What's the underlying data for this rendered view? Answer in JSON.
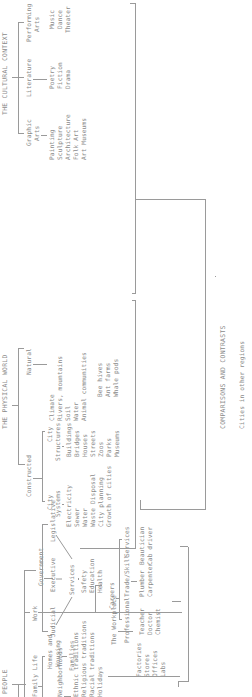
{
  "diagram": {
    "type": "tree",
    "orientation": "rotated-90-ccw",
    "line_color": "#9a9a9a",
    "text_color": "#8a8a8a",
    "sections": {
      "cultural": {
        "title": "THE CULTURAL CONTEXT",
        "branches": [
          {
            "label_1": "Performing",
            "label_2": "Arts",
            "items": [
              "Music",
              "Dance",
              "Theater"
            ]
          },
          {
            "label_1": "Literature",
            "label_2": "",
            "items": [
              "Poetry",
              "Fiction",
              "Drama"
            ]
          },
          {
            "label_1": "Graphic",
            "label_2": "Arts",
            "items": [
              "Painting",
              "Sculpture",
              "Architecture",
              "Folk Art",
              "Art Museums"
            ]
          }
        ]
      },
      "physical": {
        "title": "THE PHYSICAL WORLD",
        "natural": {
          "label": "Natural",
          "items": [
            "Climate",
            "Rivers, mountains",
            "Soil",
            "Water",
            "Animal communities"
          ],
          "sub_items": [
            "Bee hives",
            "Ant farms",
            "Whale pods"
          ]
        },
        "constructed": {
          "label": "Constructed",
          "structures": {
            "label_1": "City",
            "label_2": "Structures",
            "items": [
              "Buildings",
              "Bridges",
              "Houses",
              "Streets",
              "Zoos",
              "Parks",
              "Museums"
            ]
          },
          "systems": {
            "label_1": "City",
            "label_2": "Systems",
            "items": [
              "Electricity",
              "Sewer",
              "Water",
              "Waste Disposal",
              "City planning",
              "Growth of cities"
            ]
          }
        }
      },
      "people": {
        "title": "PEOPLE",
        "government": {
          "label": "Government",
          "branches": [
            "Legislative",
            "Executive",
            "Judicial"
          ],
          "services": {
            "label": "Services",
            "items": [
              "Safety",
              "Education",
              "Health"
            ]
          }
        },
        "work": {
          "label": "Work",
          "careers": {
            "label": "Careers",
            "groups": [
              {
                "label": "Services",
                "items": [
                  "Beautician",
                  "Cab driver"
                ]
              },
              {
                "label": "Trade/Skill",
                "items": [
                  "Plumber",
                  "Carpenter"
                ]
              },
              {
                "label": "Professional",
                "items": [
                  "Teacher",
                  "Doctor",
                  "Chemist"
                ]
              }
            ]
          },
          "workplace": {
            "label": "The Workplace",
            "items": [
              "Factories",
              "Stores",
              "Offices",
              "Labs"
            ]
          }
        },
        "family": {
          "label": "Family Life",
          "homes": {
            "label_1": "Homes and",
            "label_2": "Housing",
            "items": [
              "Families"
            ]
          },
          "neighborhoods": {
            "label": "Neighborhoods",
            "items": [
              "Ethnic traditions",
              "Religious traditions",
              "Racial traditions",
              "Holidays"
            ]
          }
        }
      }
    },
    "footer": {
      "title": "COMPARISONS AND CONTRASTS",
      "subtitle": "Cities in other regions"
    }
  }
}
